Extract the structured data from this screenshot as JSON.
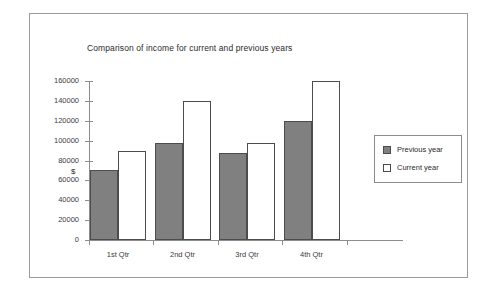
{
  "chart_data": {
    "type": "bar",
    "title": "Comparison of income for current and previous years",
    "xlabel": "",
    "ylabel": "$",
    "categories": [
      "1st Qtr",
      "2nd Qtr",
      "3rd Qtr",
      "4th Qtr"
    ],
    "series": [
      {
        "name": "Previous year",
        "values": [
          70000,
          98000,
          88000,
          120000
        ],
        "color": "#808080"
      },
      {
        "name": "Current year",
        "values": [
          90000,
          140000,
          98000,
          160000
        ],
        "color": "#ffffff"
      }
    ],
    "ylim": [
      0,
      160000
    ],
    "ytick_step": 20000,
    "ytick_labels": [
      "160000",
      "140000",
      "120000",
      "100000",
      "80000",
      "60000",
      "40000",
      "20000",
      "0"
    ],
    "ytick_values": [
      160000,
      140000,
      120000,
      100000,
      80000,
      60000,
      40000,
      20000,
      0
    ],
    "grid": false,
    "legend_position": "right"
  },
  "legend": {
    "items": [
      {
        "label": "Previous year",
        "swatch": "previous"
      },
      {
        "label": "Current year",
        "swatch": "current"
      }
    ]
  },
  "colors": {
    "previous_year_fill": "#808080",
    "current_year_fill": "#ffffff",
    "bar_outline": "#4c4c4c",
    "axis": "#8c8c8c",
    "frame": "#9a9a9a",
    "background": "#ffffff",
    "text": "#2b2b2b"
  }
}
